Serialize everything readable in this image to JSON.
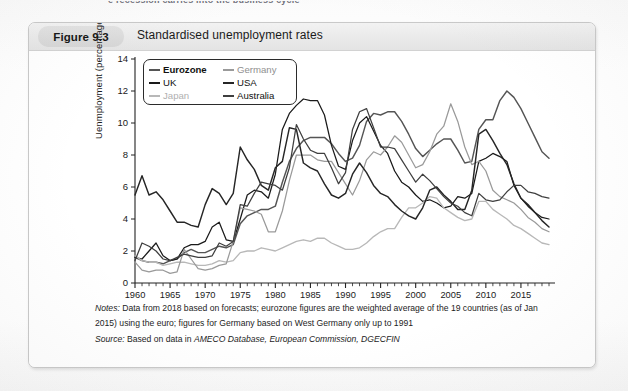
{
  "page": {
    "cut_off_top_text": "e recession carries into the business cycle"
  },
  "figure": {
    "badge": "Figure 9.3",
    "title": "Standardised unemployment rates",
    "notes_label": "Notes:",
    "notes_text_1": "Data from 2018 based on forecasts; eurozone figures are the weighted average of the 19 countries (as of Jan",
    "notes_text_2": "2015) using the euro; figures for Germany based on West Germany only up to 1991",
    "source_label": "Source:",
    "source_text_plain": "Based on data in ",
    "source_text_italic": "AMECO Database, European Commission, DGECFIN"
  },
  "chart_data": {
    "type": "line",
    "title": "Standardised unemployment rates",
    "xlabel": "",
    "ylabel": "Uenmployment (percentage of workforce)",
    "xlim": [
      1960,
      2019
    ],
    "ylim": [
      0,
      14
    ],
    "ytick_values": [
      0,
      2,
      4,
      6,
      8,
      10,
      12,
      14
    ],
    "xtick_labels": [
      "1960",
      "1965",
      "1970",
      "1975",
      "1980",
      "1985",
      "1990",
      "1995",
      "2000",
      "2005",
      "2010",
      "2015"
    ],
    "xtick_values": [
      1960,
      1965,
      1970,
      1975,
      1980,
      1985,
      1990,
      1995,
      2000,
      2005,
      2010,
      2015
    ],
    "minor_tick_interval": 1,
    "grid": false,
    "legend_position": "top-left",
    "x": [
      1960,
      1961,
      1962,
      1963,
      1964,
      1965,
      1966,
      1967,
      1968,
      1969,
      1970,
      1971,
      1972,
      1973,
      1974,
      1975,
      1976,
      1977,
      1978,
      1979,
      1980,
      1981,
      1982,
      1983,
      1984,
      1985,
      1986,
      1987,
      1988,
      1989,
      1990,
      1991,
      1992,
      1993,
      1994,
      1995,
      1996,
      1997,
      1998,
      1999,
      2000,
      2001,
      2002,
      2003,
      2004,
      2005,
      2006,
      2007,
      2008,
      2009,
      2010,
      2011,
      2012,
      2013,
      2014,
      2015,
      2016,
      2017,
      2018,
      2019
    ],
    "series": [
      {
        "name": "Eurozone",
        "color": "#555555",
        "emphasis": "bold",
        "values": [
          1.6,
          1.4,
          1.3,
          1.3,
          1.2,
          1.4,
          1.5,
          1.9,
          2.1,
          1.9,
          1.9,
          2.1,
          2.3,
          2.2,
          2.4,
          3.7,
          4.2,
          4.4,
          4.6,
          4.6,
          4.8,
          6.3,
          7.6,
          8.4,
          8.9,
          9.1,
          9.1,
          9.1,
          8.7,
          8.1,
          7.6,
          7.8,
          8.6,
          10.1,
          10.6,
          10.5,
          10.7,
          10.7,
          10.1,
          9.3,
          8.4,
          7.9,
          8.3,
          8.7,
          9.0,
          9.0,
          8.3,
          7.5,
          7.6,
          9.6,
          10.2,
          10.2,
          11.4,
          12.0,
          11.6,
          10.9,
          10.0,
          9.1,
          8.2,
          7.8
        ]
      },
      {
        "name": "UK",
        "color": "#1a1a1a",
        "emphasis": "normal",
        "values": [
          1.6,
          1.5,
          2.0,
          2.5,
          1.7,
          1.4,
          1.5,
          2.2,
          2.4,
          2.4,
          2.6,
          3.5,
          3.8,
          2.7,
          2.6,
          4.0,
          5.5,
          5.8,
          5.7,
          5.3,
          6.8,
          9.6,
          10.6,
          11.1,
          11.5,
          11.4,
          11.4,
          10.5,
          8.6,
          7.3,
          7.1,
          8.9,
          10.0,
          10.4,
          9.5,
          8.6,
          8.1,
          7.0,
          6.3,
          6.0,
          5.5,
          5.1,
          5.2,
          5.0,
          4.7,
          4.8,
          5.4,
          5.3,
          5.6,
          7.6,
          7.8,
          8.1,
          7.9,
          7.6,
          6.1,
          5.3,
          4.8,
          4.4,
          4.1,
          4.0
        ]
      },
      {
        "name": "Japan",
        "color": "#b8b8b8",
        "emphasis": "light",
        "values": [
          1.7,
          1.4,
          1.3,
          1.3,
          1.1,
          1.2,
          1.3,
          1.3,
          1.2,
          1.1,
          1.1,
          1.2,
          1.4,
          1.3,
          1.4,
          1.9,
          2.0,
          2.0,
          2.2,
          2.1,
          2.0,
          2.2,
          2.4,
          2.6,
          2.7,
          2.6,
          2.8,
          2.8,
          2.5,
          2.3,
          2.1,
          2.1,
          2.2,
          2.5,
          2.9,
          3.2,
          3.4,
          3.4,
          4.1,
          4.7,
          4.7,
          5.0,
          5.4,
          5.3,
          4.7,
          4.4,
          4.1,
          3.9,
          4.0,
          5.1,
          5.1,
          4.6,
          4.3,
          4.0,
          3.6,
          3.4,
          3.1,
          2.8,
          2.5,
          2.4
        ]
      },
      {
        "name": "Germany",
        "color": "#9a9a9a",
        "emphasis": "normal",
        "values": [
          1.3,
          0.8,
          0.7,
          0.8,
          0.8,
          0.6,
          0.7,
          2.1,
          1.5,
          0.9,
          0.8,
          0.9,
          1.1,
          1.2,
          2.6,
          4.7,
          4.6,
          4.5,
          4.3,
          3.2,
          3.2,
          4.5,
          6.4,
          8.0,
          8.0,
          8.0,
          7.7,
          7.6,
          7.6,
          6.9,
          6.2,
          5.5,
          6.4,
          7.7,
          8.2,
          8.0,
          8.5,
          9.2,
          8.8,
          8.0,
          7.2,
          7.4,
          8.2,
          9.3,
          9.8,
          11.2,
          10.1,
          8.5,
          7.4,
          7.6,
          7.0,
          5.8,
          5.4,
          5.2,
          5.0,
          4.6,
          4.1,
          3.8,
          3.4,
          3.2
        ]
      },
      {
        "name": "USA",
        "color": "#262626",
        "emphasis": "bold",
        "values": [
          5.5,
          6.7,
          5.5,
          5.7,
          5.2,
          4.5,
          3.8,
          3.8,
          3.6,
          3.5,
          4.9,
          5.9,
          5.6,
          4.9,
          5.6,
          8.5,
          7.7,
          7.1,
          6.1,
          5.8,
          7.2,
          7.6,
          9.7,
          9.6,
          7.5,
          7.2,
          7.0,
          6.2,
          5.5,
          5.3,
          5.6,
          6.8,
          7.5,
          6.9,
          6.1,
          5.6,
          5.4,
          4.9,
          4.5,
          4.2,
          4.0,
          4.7,
          5.8,
          6.0,
          5.5,
          5.1,
          4.6,
          4.6,
          5.8,
          9.3,
          9.6,
          8.9,
          8.1,
          7.4,
          6.2,
          5.3,
          4.9,
          4.4,
          3.9,
          3.5
        ]
      },
      {
        "name": "Australia",
        "color": "#3f3f3f",
        "emphasis": "normal",
        "values": [
          1.4,
          2.5,
          2.3,
          2.0,
          1.5,
          1.4,
          1.6,
          1.8,
          1.7,
          1.6,
          1.6,
          1.7,
          2.5,
          2.3,
          2.6,
          4.9,
          4.8,
          5.6,
          6.3,
          6.2,
          6.1,
          5.8,
          7.2,
          9.9,
          9.0,
          8.3,
          8.1,
          8.1,
          7.2,
          6.2,
          6.9,
          9.6,
          10.7,
          10.9,
          9.7,
          8.5,
          8.5,
          8.4,
          7.7,
          7.0,
          6.3,
          6.8,
          6.4,
          5.9,
          5.4,
          5.0,
          4.8,
          4.4,
          4.2,
          5.6,
          5.2,
          5.1,
          5.2,
          5.7,
          6.1,
          6.1,
          5.7,
          5.6,
          5.4,
          5.3
        ]
      }
    ]
  },
  "legend": {
    "items": [
      {
        "label": "Eurozone",
        "color": "#555555",
        "bold": true
      },
      {
        "label": "Germany",
        "color": "#9a9a9a",
        "bold": false
      },
      {
        "label": "UK",
        "color": "#1a1a1a",
        "bold": false
      },
      {
        "label": "USA",
        "color": "#262626",
        "bold": false
      },
      {
        "label": "Japan",
        "color": "#b8b8b8",
        "bold": false
      },
      {
        "label": "Australia",
        "color": "#3f3f3f",
        "bold": false
      }
    ]
  }
}
